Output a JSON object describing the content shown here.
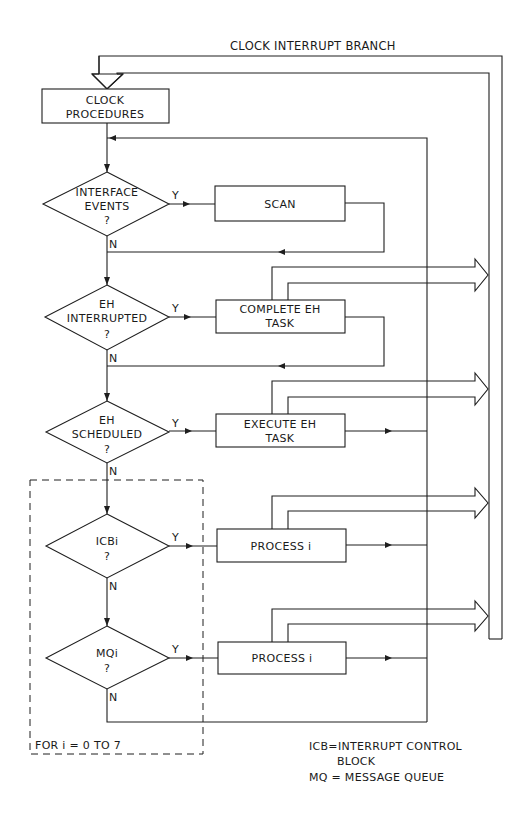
{
  "diagram": {
    "title": "CLOCK INTERRUPT BRANCH",
    "start": {
      "line1": "CLOCK",
      "line2": "PROCEDURES"
    },
    "decisions": [
      {
        "id": "interface-events",
        "lines": [
          "INTERFACE",
          "EVENTS",
          "?"
        ],
        "yes": "Y",
        "no": "N"
      },
      {
        "id": "eh-interrupted",
        "lines": [
          "EH",
          "INTERRUPTED",
          "?"
        ],
        "yes": "Y",
        "no": "N"
      },
      {
        "id": "eh-scheduled",
        "lines": [
          "EH",
          "SCHEDULED",
          "?"
        ],
        "yes": "Y",
        "no": "N"
      },
      {
        "id": "icb-i",
        "lines": [
          "ICBi",
          "?"
        ],
        "yes": "Y",
        "no": "N"
      },
      {
        "id": "mq-i",
        "lines": [
          "MQi",
          "?"
        ],
        "yes": "Y",
        "no": "N"
      }
    ],
    "processes": [
      {
        "id": "scan",
        "lines": [
          "SCAN"
        ]
      },
      {
        "id": "complete-eh-task",
        "lines": [
          "COMPLETE  EH",
          "TASK"
        ]
      },
      {
        "id": "execute-eh-task",
        "lines": [
          "EXECUTE  EH",
          "TASK"
        ]
      },
      {
        "id": "process-i-icb",
        "lines": [
          "PROCESS i"
        ]
      },
      {
        "id": "process-i-mq",
        "lines": [
          "PROCESS i"
        ]
      }
    ],
    "loop_label": "FOR  i  =  0  TO  7",
    "legend": {
      "line1": "ICB=INTERRUPT  CONTROL",
      "line2": "BLOCK",
      "line3": "MQ  = MESSAGE  QUEUE"
    },
    "colors": {
      "line": "#1e1e1e",
      "background": "#ffffff"
    }
  }
}
